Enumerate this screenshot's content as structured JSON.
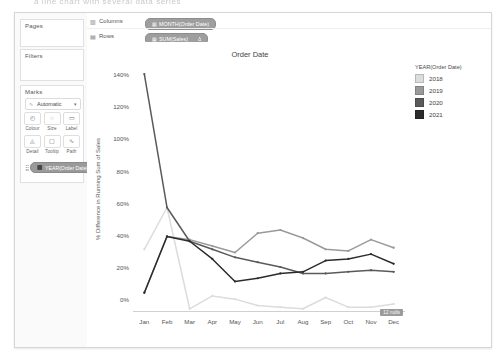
{
  "top_caption": "a line chart with several data series",
  "left_panel": {
    "pages_label": "Pages",
    "filters_label": "Filters",
    "marks_label": "Marks",
    "mark_type": "Automatic",
    "mark_type_icon": "line-icon",
    "dropdown_icon": "▾",
    "buttons": [
      {
        "label": "Colour",
        "icon": "◴",
        "name": "colour"
      },
      {
        "label": "Size",
        "icon": "◌",
        "name": "size"
      },
      {
        "label": "Label",
        "icon": "▭",
        "name": "label"
      },
      {
        "label": "Detail",
        "icon": "◬",
        "name": "detail"
      },
      {
        "label": "Tooltip",
        "icon": "▢",
        "name": "tooltip"
      },
      {
        "label": "Path",
        "icon": "∿",
        "name": "path"
      }
    ],
    "colour_pill": "YEAR(Order Date)",
    "colour_pill_icon": "⬛"
  },
  "shelves": {
    "columns_label": "Columns",
    "rows_label": "Rows",
    "columns_icon": "columns-icon",
    "rows_icon": "rows-icon",
    "columns_pill": "MONTH(Order Date)",
    "columns_pill_icon": "▦",
    "rows_pill": "SUM(Sales)",
    "rows_pill_icon": "▦",
    "rows_pill_badge": "Δ"
  },
  "legend": {
    "title": "YEAR(Order Date)",
    "items": [
      {
        "label": "2018",
        "color": "#dcdcdc"
      },
      {
        "label": "2019",
        "color": "#9a9a9a"
      },
      {
        "label": "2020",
        "color": "#5a5a5a"
      },
      {
        "label": "2021",
        "color": "#2b2b2b"
      }
    ]
  },
  "nulls_badge": "12 nulls",
  "chart_data": {
    "type": "line",
    "title": "Order Date",
    "xlabel": "",
    "ylabel": "% Difference in Running Sum of Sales",
    "x": [
      "Jan",
      "Feb",
      "Mar",
      "Apr",
      "May",
      "Jun",
      "Jul",
      "Aug",
      "Sep",
      "Oct",
      "Nov",
      "Dec"
    ],
    "ylim": [
      -8,
      145
    ],
    "yticks": [
      0,
      20,
      40,
      60,
      80,
      100,
      120,
      140
    ],
    "ytick_labels": [
      "0%",
      "20%",
      "40%",
      "60%",
      "80%",
      "100%",
      "120%",
      "140%"
    ],
    "grid": false,
    "legend_position": "right",
    "series": [
      {
        "name": "2018",
        "color": "#dcdcdc",
        "values": [
          31,
          57,
          -6,
          2,
          0,
          -4,
          -5,
          -6,
          1,
          -5,
          -5,
          -3
        ]
      },
      {
        "name": "2019",
        "color": "#9a9a9a",
        "values": [
          4,
          39,
          37,
          33,
          29,
          41,
          43,
          38,
          31,
          30,
          37,
          32
        ]
      },
      {
        "name": "2020",
        "color": "#5a5a5a",
        "values": [
          140,
          57,
          36,
          31,
          26,
          23,
          20,
          16,
          16,
          17,
          18,
          17
        ]
      },
      {
        "name": "2021",
        "color": "#2b2b2b",
        "values": [
          4,
          39,
          36,
          25,
          11,
          13,
          16,
          17,
          24,
          25,
          28,
          22
        ]
      }
    ]
  }
}
